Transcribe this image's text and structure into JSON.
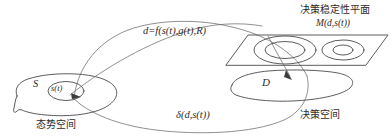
{
  "diagram": {
    "title_text": "决策稳定性平面",
    "labels": {
      "formula_top": "d=f(s(t),g(t),R)",
      "formula_bottom": "δ(d,s(t))",
      "plane_title": "决策稳定性平面",
      "plane_measure": "M(d,s(t))",
      "set_s": "S",
      "state_st": "s(t)",
      "set_d": "D",
      "space_left": "态势空间",
      "space_right": "决策空间"
    },
    "colors": {
      "stroke": "#4a4a4a",
      "stroke_light": "#6b6b6b",
      "arrow": "#3c3c3c",
      "background": "#ffffff",
      "text": "#2b2b2b"
    },
    "shapes": {
      "situation_blob": "left irregular closed blob",
      "state_ellipse": "inner small ellipse s(t)",
      "decision_blob": "right irregular closed blob D",
      "stability_plane": "parallelogram with two concentric ellipse pairs",
      "mapping_arc_upper": "large arc from s(t) up and right to plane",
      "mapping_arc_lower": "large arc from plane down and left to s(t)"
    }
  }
}
